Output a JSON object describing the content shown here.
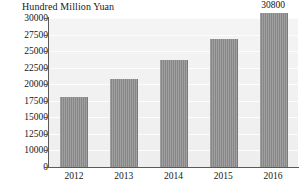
{
  "chart_data": {
    "type": "bar",
    "title": "Hundred Million Yuan",
    "xlabel": "",
    "ylabel": "Hundred Million Yuan",
    "categories": [
      "2012",
      "2013",
      "2014",
      "2015",
      "2016"
    ],
    "values": [
      18000,
      20800,
      23600,
      26900,
      30800
    ],
    "data_labels": [
      "",
      "",
      "",
      "",
      "30800"
    ],
    "ytick_labels": [
      "30000",
      "27500",
      "25000",
      "22500",
      "20000",
      "17500",
      "15000",
      "12500",
      "10000",
      "0"
    ],
    "ytick_values": [
      30000,
      27500,
      25000,
      22500,
      20000,
      17500,
      15000,
      12500,
      10000,
      0
    ],
    "ylim": [
      0,
      31250
    ],
    "axis_break": true,
    "axis_break_note": "y-axis jumps from 0 to 10000; above 10000 ticks are evenly spaced every 2500",
    "grid": true,
    "legend": null,
    "bar_color": "#8e8e8e",
    "plot_background": "#f2f2f2",
    "axis_color": "#5a5a5a"
  },
  "colors": {
    "bar": "#8e8e8e",
    "plot_bg": "#f2f2f2",
    "axis": "#5a5a5a",
    "text": "#161616",
    "gridline": "#fdfdfd"
  }
}
